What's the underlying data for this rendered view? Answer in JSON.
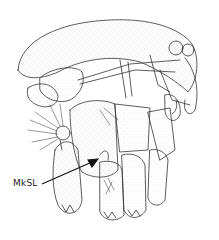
{
  "figure": {
    "type": "scientific line illustration",
    "annotations": [
      {
        "text": "MkSL",
        "x": 13,
        "y": 184,
        "arrow_to": [
          97,
          160
        ]
      }
    ],
    "colors": {
      "ink": "#333333",
      "stipple": "#555555",
      "background": "#ffffff"
    }
  }
}
